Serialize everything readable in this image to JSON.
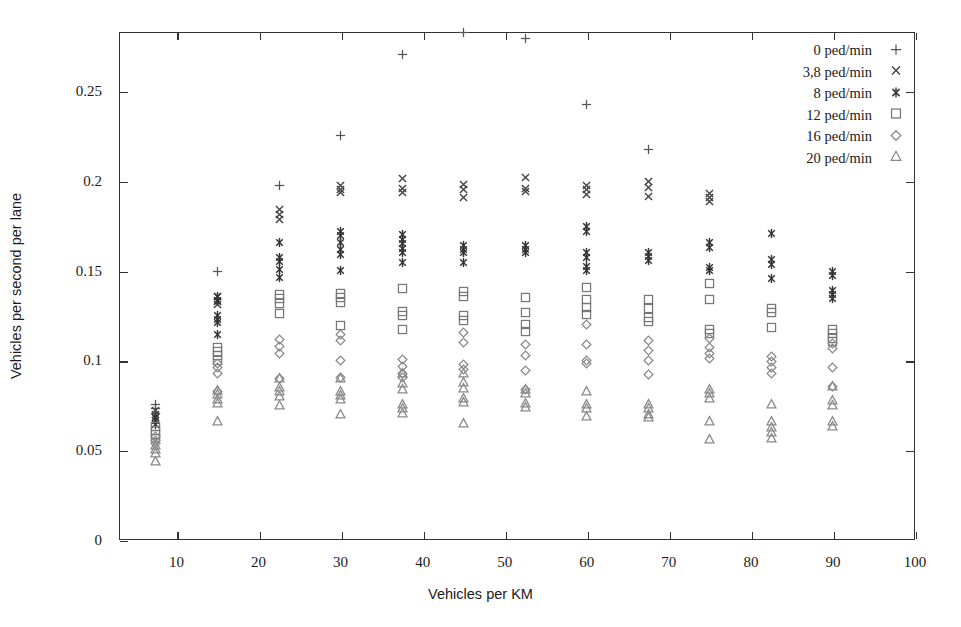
{
  "chart_data": {
    "type": "scatter",
    "title": "",
    "xlabel": "Vehicles per KM",
    "ylabel": "Vehicles per second per lane",
    "xlim": [
      3,
      100
    ],
    "ylim": [
      0,
      0.283
    ],
    "xticks": [
      10,
      20,
      30,
      40,
      50,
      60,
      70,
      80,
      90,
      100
    ],
    "xticklabels": [
      "10",
      "20",
      "30",
      "40",
      "50",
      "60",
      "70",
      "80",
      "90",
      "100"
    ],
    "yticks": [
      0,
      0.05,
      0.1,
      0.15,
      0.2,
      0.25
    ],
    "yticklabels": [
      "0",
      "0.05",
      "0.1",
      "0.15",
      "0.2",
      "0.25"
    ],
    "grid": false,
    "legend_position": "top-right",
    "frame": true,
    "series": [
      {
        "name": "0 ped/min",
        "marker": "plus",
        "color": "#555555",
        "points": [
          {
            "x": 7.5,
            "y": 0.0755
          },
          {
            "x": 7.5,
            "y": 0.0735
          },
          {
            "x": 7.5,
            "y": 0.0705
          },
          {
            "x": 15,
            "y": 0.1495
          },
          {
            "x": 22.5,
            "y": 0.1975
          },
          {
            "x": 30,
            "y": 0.2255
          },
          {
            "x": 37.5,
            "y": 0.2705
          },
          {
            "x": 45,
            "y": 0.2825
          },
          {
            "x": 52.5,
            "y": 0.2795
          },
          {
            "x": 60,
            "y": 0.2425
          },
          {
            "x": 67.5,
            "y": 0.2175
          }
        ]
      },
      {
        "name": "3,8 ped/min",
        "marker": "cross",
        "color": "#444444",
        "points": [
          {
            "x": 7.5,
            "y": 0.072
          },
          {
            "x": 7.5,
            "y": 0.07
          },
          {
            "x": 7.5,
            "y": 0.068
          },
          {
            "x": 15,
            "y": 0.1355
          },
          {
            "x": 15,
            "y": 0.133
          },
          {
            "x": 15,
            "y": 0.131
          },
          {
            "x": 22.5,
            "y": 0.184
          },
          {
            "x": 22.5,
            "y": 0.1815
          },
          {
            "x": 22.5,
            "y": 0.1785
          },
          {
            "x": 30,
            "y": 0.1975
          },
          {
            "x": 30,
            "y": 0.1955
          },
          {
            "x": 30,
            "y": 0.1935
          },
          {
            "x": 37.5,
            "y": 0.2015
          },
          {
            "x": 37.5,
            "y": 0.196
          },
          {
            "x": 37.5,
            "y": 0.1935
          },
          {
            "x": 45,
            "y": 0.198
          },
          {
            "x": 45,
            "y": 0.1955
          },
          {
            "x": 45,
            "y": 0.191
          },
          {
            "x": 52.5,
            "y": 0.202
          },
          {
            "x": 52.5,
            "y": 0.196
          },
          {
            "x": 52.5,
            "y": 0.194
          },
          {
            "x": 60,
            "y": 0.1975
          },
          {
            "x": 60,
            "y": 0.195
          },
          {
            "x": 60,
            "y": 0.1925
          },
          {
            "x": 67.5,
            "y": 0.1995
          },
          {
            "x": 67.5,
            "y": 0.1965
          },
          {
            "x": 67.5,
            "y": 0.1915
          },
          {
            "x": 75,
            "y": 0.193
          },
          {
            "x": 75,
            "y": 0.191
          },
          {
            "x": 75,
            "y": 0.1885
          }
        ]
      },
      {
        "name": "8 ped/min",
        "marker": "star",
        "color": "#333333",
        "points": [
          {
            "x": 7.5,
            "y": 0.0685
          },
          {
            "x": 7.5,
            "y": 0.0665
          },
          {
            "x": 7.5,
            "y": 0.0645
          },
          {
            "x": 15,
            "y": 0.1355
          },
          {
            "x": 15,
            "y": 0.1335
          },
          {
            "x": 15,
            "y": 0.125
          },
          {
            "x": 15,
            "y": 0.123
          },
          {
            "x": 15,
            "y": 0.121
          },
          {
            "x": 15,
            "y": 0.1145
          },
          {
            "x": 22.5,
            "y": 0.1655
          },
          {
            "x": 22.5,
            "y": 0.1575
          },
          {
            "x": 22.5,
            "y": 0.155
          },
          {
            "x": 22.5,
            "y": 0.1505
          },
          {
            "x": 22.5,
            "y": 0.146
          },
          {
            "x": 30,
            "y": 0.172
          },
          {
            "x": 30,
            "y": 0.1695
          },
          {
            "x": 30,
            "y": 0.1655
          },
          {
            "x": 30,
            "y": 0.162
          },
          {
            "x": 30,
            "y": 0.159
          },
          {
            "x": 30,
            "y": 0.15
          },
          {
            "x": 37.5,
            "y": 0.17
          },
          {
            "x": 37.5,
            "y": 0.1675
          },
          {
            "x": 37.5,
            "y": 0.165
          },
          {
            "x": 37.5,
            "y": 0.1625
          },
          {
            "x": 37.5,
            "y": 0.16
          },
          {
            "x": 37.5,
            "y": 0.1545
          },
          {
            "x": 45,
            "y": 0.164
          },
          {
            "x": 45,
            "y": 0.162
          },
          {
            "x": 45,
            "y": 0.16
          },
          {
            "x": 45,
            "y": 0.1545
          },
          {
            "x": 52.5,
            "y": 0.164
          },
          {
            "x": 52.5,
            "y": 0.162
          },
          {
            "x": 52.5,
            "y": 0.16
          },
          {
            "x": 60,
            "y": 0.1745
          },
          {
            "x": 60,
            "y": 0.172
          },
          {
            "x": 60,
            "y": 0.16
          },
          {
            "x": 60,
            "y": 0.1575
          },
          {
            "x": 60,
            "y": 0.1525
          },
          {
            "x": 60,
            "y": 0.15
          },
          {
            "x": 67.5,
            "y": 0.16
          },
          {
            "x": 67.5,
            "y": 0.158
          },
          {
            "x": 67.5,
            "y": 0.1555
          },
          {
            "x": 75,
            "y": 0.1655
          },
          {
            "x": 75,
            "y": 0.163
          },
          {
            "x": 75,
            "y": 0.152
          },
          {
            "x": 75,
            "y": 0.15
          },
          {
            "x": 82.5,
            "y": 0.1705
          },
          {
            "x": 82.5,
            "y": 0.156
          },
          {
            "x": 82.5,
            "y": 0.1535
          },
          {
            "x": 82.5,
            "y": 0.1455
          },
          {
            "x": 90,
            "y": 0.1495
          },
          {
            "x": 90,
            "y": 0.1475
          },
          {
            "x": 90,
            "y": 0.139
          },
          {
            "x": 90,
            "y": 0.137
          },
          {
            "x": 90,
            "y": 0.1345
          }
        ]
      },
      {
        "name": "12 ped/min",
        "marker": "square",
        "color": "#777777",
        "points": [
          {
            "x": 7.5,
            "y": 0.063
          },
          {
            "x": 7.5,
            "y": 0.061
          },
          {
            "x": 7.5,
            "y": 0.059
          },
          {
            "x": 7.5,
            "y": 0.0565
          },
          {
            "x": 15,
            "y": 0.1075
          },
          {
            "x": 15,
            "y": 0.105
          },
          {
            "x": 15,
            "y": 0.103
          },
          {
            "x": 15,
            "y": 0.1
          },
          {
            "x": 22.5,
            "y": 0.137
          },
          {
            "x": 22.5,
            "y": 0.1345
          },
          {
            "x": 22.5,
            "y": 0.132
          },
          {
            "x": 22.5,
            "y": 0.126
          },
          {
            "x": 30,
            "y": 0.1375
          },
          {
            "x": 30,
            "y": 0.135
          },
          {
            "x": 30,
            "y": 0.1325
          },
          {
            "x": 30,
            "y": 0.1195
          },
          {
            "x": 37.5,
            "y": 0.14
          },
          {
            "x": 37.5,
            "y": 0.1275
          },
          {
            "x": 37.5,
            "y": 0.125
          },
          {
            "x": 37.5,
            "y": 0.117
          },
          {
            "x": 45,
            "y": 0.1385
          },
          {
            "x": 45,
            "y": 0.1355
          },
          {
            "x": 45,
            "y": 0.125
          },
          {
            "x": 45,
            "y": 0.1225
          },
          {
            "x": 52.5,
            "y": 0.135
          },
          {
            "x": 52.5,
            "y": 0.127
          },
          {
            "x": 52.5,
            "y": 0.12
          },
          {
            "x": 52.5,
            "y": 0.116
          },
          {
            "x": 60,
            "y": 0.1405
          },
          {
            "x": 60,
            "y": 0.134
          },
          {
            "x": 60,
            "y": 0.1295
          },
          {
            "x": 60,
            "y": 0.1255
          },
          {
            "x": 67.5,
            "y": 0.134
          },
          {
            "x": 67.5,
            "y": 0.129
          },
          {
            "x": 67.5,
            "y": 0.124
          },
          {
            "x": 67.5,
            "y": 0.1215
          },
          {
            "x": 75,
            "y": 0.143
          },
          {
            "x": 75,
            "y": 0.134
          },
          {
            "x": 75,
            "y": 0.117
          },
          {
            "x": 75,
            "y": 0.115
          },
          {
            "x": 82.5,
            "y": 0.129
          },
          {
            "x": 82.5,
            "y": 0.1265
          },
          {
            "x": 82.5,
            "y": 0.1185
          },
          {
            "x": 90,
            "y": 0.1175
          },
          {
            "x": 90,
            "y": 0.115
          },
          {
            "x": 90,
            "y": 0.1125
          },
          {
            "x": 90,
            "y": 0.1105
          }
        ]
      },
      {
        "name": "16 ped/min",
        "marker": "diamond",
        "color": "#888888",
        "points": [
          {
            "x": 7.5,
            "y": 0.0575
          },
          {
            "x": 7.5,
            "y": 0.0555
          },
          {
            "x": 7.5,
            "y": 0.0535
          },
          {
            "x": 15,
            "y": 0.0985
          },
          {
            "x": 15,
            "y": 0.096
          },
          {
            "x": 15,
            "y": 0.093
          },
          {
            "x": 15,
            "y": 0.083
          },
          {
            "x": 22.5,
            "y": 0.1115
          },
          {
            "x": 22.5,
            "y": 0.108
          },
          {
            "x": 22.5,
            "y": 0.104
          },
          {
            "x": 22.5,
            "y": 0.09
          },
          {
            "x": 30,
            "y": 0.1145
          },
          {
            "x": 30,
            "y": 0.111
          },
          {
            "x": 30,
            "y": 0.1
          },
          {
            "x": 30,
            "y": 0.0905
          },
          {
            "x": 37.5,
            "y": 0.1005
          },
          {
            "x": 37.5,
            "y": 0.0965
          },
          {
            "x": 37.5,
            "y": 0.093
          },
          {
            "x": 37.5,
            "y": 0.0905
          },
          {
            "x": 45,
            "y": 0.1155
          },
          {
            "x": 45,
            "y": 0.11
          },
          {
            "x": 45,
            "y": 0.098
          },
          {
            "x": 45,
            "y": 0.095
          },
          {
            "x": 52.5,
            "y": 0.109
          },
          {
            "x": 52.5,
            "y": 0.103
          },
          {
            "x": 52.5,
            "y": 0.0945
          },
          {
            "x": 52.5,
            "y": 0.084
          },
          {
            "x": 60,
            "y": 0.12
          },
          {
            "x": 60,
            "y": 0.109
          },
          {
            "x": 60,
            "y": 0.1
          },
          {
            "x": 60,
            "y": 0.0985
          },
          {
            "x": 67.5,
            "y": 0.111
          },
          {
            "x": 67.5,
            "y": 0.1055
          },
          {
            "x": 67.5,
            "y": 0.1
          },
          {
            "x": 67.5,
            "y": 0.092
          },
          {
            "x": 75,
            "y": 0.112
          },
          {
            "x": 75,
            "y": 0.1075
          },
          {
            "x": 75,
            "y": 0.104
          },
          {
            "x": 75,
            "y": 0.101
          },
          {
            "x": 82.5,
            "y": 0.1025
          },
          {
            "x": 82.5,
            "y": 0.0995
          },
          {
            "x": 82.5,
            "y": 0.096
          },
          {
            "x": 82.5,
            "y": 0.093
          },
          {
            "x": 90,
            "y": 0.1095
          },
          {
            "x": 90,
            "y": 0.1065
          },
          {
            "x": 90,
            "y": 0.096
          },
          {
            "x": 90,
            "y": 0.0855
          }
        ]
      },
      {
        "name": "20 ped/min",
        "marker": "triangle",
        "color": "#8a8a8a",
        "points": [
          {
            "x": 7.5,
            "y": 0.0525
          },
          {
            "x": 7.5,
            "y": 0.0505
          },
          {
            "x": 7.5,
            "y": 0.048
          },
          {
            "x": 7.5,
            "y": 0.0435
          },
          {
            "x": 15,
            "y": 0.0835
          },
          {
            "x": 15,
            "y": 0.081
          },
          {
            "x": 15,
            "y": 0.0785
          },
          {
            "x": 15,
            "y": 0.076
          },
          {
            "x": 15,
            "y": 0.066
          },
          {
            "x": 22.5,
            "y": 0.09
          },
          {
            "x": 22.5,
            "y": 0.085
          },
          {
            "x": 22.5,
            "y": 0.0825
          },
          {
            "x": 22.5,
            "y": 0.08
          },
          {
            "x": 22.5,
            "y": 0.075
          },
          {
            "x": 30,
            "y": 0.09
          },
          {
            "x": 30,
            "y": 0.083
          },
          {
            "x": 30,
            "y": 0.0805
          },
          {
            "x": 30,
            "y": 0.0785
          },
          {
            "x": 30,
            "y": 0.07
          },
          {
            "x": 37.5,
            "y": 0.093
          },
          {
            "x": 37.5,
            "y": 0.087
          },
          {
            "x": 37.5,
            "y": 0.084
          },
          {
            "x": 37.5,
            "y": 0.0755
          },
          {
            "x": 37.5,
            "y": 0.073
          },
          {
            "x": 37.5,
            "y": 0.0705
          },
          {
            "x": 45,
            "y": 0.093
          },
          {
            "x": 45,
            "y": 0.0875
          },
          {
            "x": 45,
            "y": 0.0845
          },
          {
            "x": 45,
            "y": 0.079
          },
          {
            "x": 45,
            "y": 0.0765
          },
          {
            "x": 45,
            "y": 0.065
          },
          {
            "x": 52.5,
            "y": 0.084
          },
          {
            "x": 52.5,
            "y": 0.0815
          },
          {
            "x": 52.5,
            "y": 0.076
          },
          {
            "x": 52.5,
            "y": 0.074
          },
          {
            "x": 60,
            "y": 0.083
          },
          {
            "x": 60,
            "y": 0.0755
          },
          {
            "x": 60,
            "y": 0.073
          },
          {
            "x": 60,
            "y": 0.069
          },
          {
            "x": 67.5,
            "y": 0.0755
          },
          {
            "x": 67.5,
            "y": 0.073
          },
          {
            "x": 67.5,
            "y": 0.07
          },
          {
            "x": 67.5,
            "y": 0.068
          },
          {
            "x": 75,
            "y": 0.084
          },
          {
            "x": 75,
            "y": 0.0815
          },
          {
            "x": 75,
            "y": 0.079
          },
          {
            "x": 75,
            "y": 0.066
          },
          {
            "x": 75,
            "y": 0.056
          },
          {
            "x": 82.5,
            "y": 0.0755
          },
          {
            "x": 82.5,
            "y": 0.066
          },
          {
            "x": 82.5,
            "y": 0.0625
          },
          {
            "x": 82.5,
            "y": 0.06
          },
          {
            "x": 82.5,
            "y": 0.0565
          },
          {
            "x": 90,
            "y": 0.0855
          },
          {
            "x": 90,
            "y": 0.0775
          },
          {
            "x": 90,
            "y": 0.075
          },
          {
            "x": 90,
            "y": 0.066
          },
          {
            "x": 90,
            "y": 0.063
          }
        ]
      }
    ]
  },
  "legend": {
    "entries": [
      {
        "label": "0 ped/min",
        "marker": "plus"
      },
      {
        "label": "3,8 ped/min",
        "marker": "cross"
      },
      {
        "label": "8 ped/min",
        "marker": "star"
      },
      {
        "label": "12 ped/min",
        "marker": "square"
      },
      {
        "label": "16 ped/min",
        "marker": "diamond"
      },
      {
        "label": "20 ped/min",
        "marker": "triangle"
      }
    ]
  }
}
